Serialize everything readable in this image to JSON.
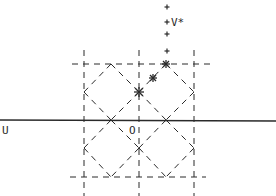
{
  "diagram": {
    "colors": {
      "ink": "#2a2a2a",
      "background": "#ffffff"
    },
    "labels": {
      "u_axis": "U",
      "origin": "O",
      "v_star": "V*"
    },
    "grid": {
      "vertical_dashed_x": [
        84,
        139,
        194
      ],
      "horizontal_dashed_y": [
        64,
        177
      ],
      "solid_axis_y": 120
    },
    "diamond_lattice_points": [
      [
        111,
        64
      ],
      [
        166,
        64
      ],
      [
        84,
        92
      ],
      [
        139,
        92
      ],
      [
        194,
        92
      ],
      [
        111,
        120
      ],
      [
        166,
        120
      ],
      [
        84,
        148
      ],
      [
        139,
        148
      ],
      [
        194,
        148
      ],
      [
        111,
        177
      ],
      [
        166,
        177
      ]
    ],
    "star_markers": [
      [
        139,
        92
      ],
      [
        153,
        78
      ],
      [
        166,
        64
      ]
    ],
    "plus_markers": [
      [
        167,
        7
      ],
      [
        167,
        22
      ],
      [
        167,
        34
      ],
      [
        167,
        51
      ]
    ]
  }
}
